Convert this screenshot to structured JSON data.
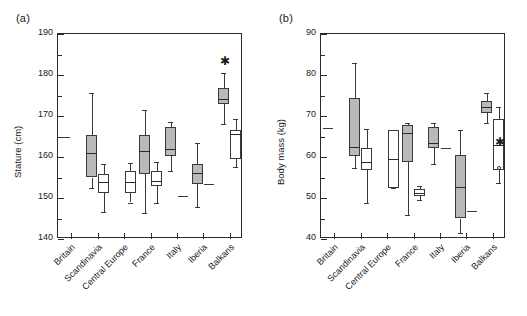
{
  "figure": {
    "panels": [
      {
        "key": "a",
        "label": "(a)",
        "ylabel": "Stature (cm)",
        "ymin": 140,
        "ymax": 190,
        "major_ticks": [
          140,
          150,
          160,
          170,
          180,
          190
        ],
        "minor_ticks": [
          145,
          155,
          165,
          175,
          185
        ]
      },
      {
        "key": "b",
        "label": "(b)",
        "ylabel": "Body mass (kg)",
        "ymin": 40,
        "ymax": 90,
        "major_ticks": [
          40,
          50,
          60,
          70,
          80,
          90
        ],
        "minor_ticks": [
          45,
          55,
          65,
          75,
          85
        ]
      }
    ],
    "categories": [
      "Britain",
      "Scandinavia",
      "Central Europe",
      "France",
      "Italy",
      "Iberia",
      "Balkans"
    ]
  },
  "chart_data": [
    {
      "type": "box",
      "panel": "(a)",
      "title": "",
      "xlabel": "",
      "ylabel": "Stature (cm)",
      "ylim": [
        140,
        190
      ],
      "grid": false,
      "legend": "none",
      "categories": [
        "Britain",
        "Scandinavia",
        "Central Europe",
        "France",
        "Italy",
        "Iberia",
        "Balkans"
      ],
      "series": [
        {
          "name": "males (filled grey boxes)",
          "fill": "#b9b9b9",
          "boxes": [
            {
              "category": "Britain",
              "single_value": 165.0
            },
            {
              "category": "Scandinavia",
              "whisker_low": 152.4,
              "q1": 155.0,
              "median": 161.0,
              "q3": 165.3,
              "whisker_high": 175.5
            },
            {
              "category": "Central Europe",
              "absent": true
            },
            {
              "category": "France",
              "whisker_low": 146.4,
              "q1": 155.8,
              "median": 161.5,
              "q3": 165.3,
              "whisker_high": 171.4
            },
            {
              "category": "Italy",
              "whisker_low": 156.5,
              "q1": 160.3,
              "median": 162.0,
              "q3": 167.4,
              "whisker_high": 168.5
            },
            {
              "category": "Iberia",
              "whisker_low": 147.8,
              "q1": 153.3,
              "median": 156.0,
              "q3": 158.4,
              "whisker_high": 163.5
            },
            {
              "category": "Balkans",
              "whisker_low": 168.0,
              "q1": 172.9,
              "median": 174.2,
              "q3": 176.9,
              "whisker_high": 180.4,
              "outlier_star": 183.4
            }
          ]
        },
        {
          "name": "females (open white boxes)",
          "fill": "#ffffff",
          "boxes": [
            {
              "category": "Britain",
              "absent": true
            },
            {
              "category": "Scandinavia",
              "whisker_low": 146.7,
              "q1": 151.2,
              "median": 154.0,
              "q3": 155.8,
              "whisker_high": 158.4
            },
            {
              "category": "Central Europe",
              "whisker_low": 148.9,
              "q1": 151.3,
              "median": 153.9,
              "q3": 156.6,
              "whisker_high": 158.6
            },
            {
              "category": "France",
              "whisker_low": 148.7,
              "q1": 152.9,
              "median": 154.2,
              "q3": 156.5,
              "whisker_high": 158.9
            },
            {
              "category": "Italy",
              "single_value": 150.4
            },
            {
              "category": "Iberia",
              "single_value": 153.4
            },
            {
              "category": "Balkans",
              "whisker_low": 157.6,
              "q1": 159.4,
              "median": 165.7,
              "q3": 166.6,
              "whisker_high": 169.2
            }
          ]
        }
      ]
    },
    {
      "type": "box",
      "panel": "(b)",
      "title": "",
      "xlabel": "",
      "ylabel": "Body mass (kg)",
      "ylim": [
        40,
        90
      ],
      "grid": false,
      "legend": "none",
      "categories": [
        "Britain",
        "Scandinavia",
        "Central Europe",
        "France",
        "Italy",
        "Iberia",
        "Balkans"
      ],
      "series": [
        {
          "name": "males (filled grey boxes)",
          "fill": "#b9b9b9",
          "boxes": [
            {
              "category": "Britain",
              "single_value": 67.0
            },
            {
              "category": "Scandinavia",
              "whisker_low": 57.2,
              "q1": 60.2,
              "median": 62.5,
              "q3": 74.4,
              "whisker_high": 82.9
            },
            {
              "category": "Central Europe",
              "absent": true
            },
            {
              "category": "France",
              "whisker_low": 45.8,
              "q1": 58.9,
              "median": 65.9,
              "q3": 67.7,
              "whisker_high": 68.3
            },
            {
              "category": "Italy",
              "whisker_low": 58.4,
              "q1": 62.2,
              "median": 63.3,
              "q3": 67.2,
              "whisker_high": 68.4
            },
            {
              "category": "Iberia",
              "whisker_low": 41.5,
              "q1": 45.0,
              "median": 52.6,
              "q3": 60.5,
              "whisker_high": 66.5
            },
            {
              "category": "Balkans",
              "whisker_low": 68.2,
              "q1": 70.7,
              "median": 72.3,
              "q3": 73.6,
              "whisker_high": 75.5
            }
          ]
        },
        {
          "name": "females (open white boxes)",
          "fill": "#ffffff",
          "boxes": [
            {
              "category": "Britain",
              "absent": true
            },
            {
              "category": "Scandinavia",
              "whisker_low": 48.9,
              "q1": 56.9,
              "median": 58.8,
              "q3": 62.2,
              "whisker_high": 66.9
            },
            {
              "category": "Central Europe",
              "whisker_low": 52.5,
              "q1": 52.5,
              "median": 59.6,
              "q3": 66.5,
              "whisker_high": 66.5
            },
            {
              "category": "France",
              "whisker_low": 49.6,
              "q1": 50.6,
              "median": 51.2,
              "q3": 52.1,
              "whisker_high": 52.9
            },
            {
              "category": "Italy",
              "single_value": 62.2
            },
            {
              "category": "Iberia",
              "single_value": 46.9
            },
            {
              "category": "Balkans",
              "whisker_low": 53.6,
              "q1": 56.9,
              "median": 62.9,
              "q3": 69.3,
              "whisker_high": 72.3,
              "outlier_star": 63.7,
              "outlier_circle": 57.3
            }
          ]
        }
      ]
    }
  ]
}
